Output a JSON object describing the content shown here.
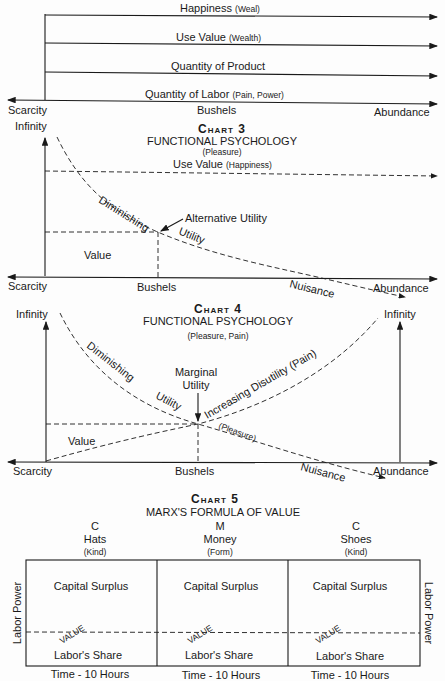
{
  "chart2": {
    "lines": [
      {
        "main": "Happiness",
        "paren": "(Weal)"
      },
      {
        "main": "Use Value",
        "paren": "(Wealth)"
      },
      {
        "main": "Quantity of Product",
        "paren": ""
      },
      {
        "main": "Quantity of Labor",
        "paren": "(Pain, Power)"
      }
    ],
    "axis_left": "Scarcity",
    "axis_center": "Bushels",
    "axis_right": "Abundance"
  },
  "chart3": {
    "title": "Chart 3",
    "subtitle": "FUNCTIONAL PSYCHOLOGY",
    "subnote": "(Pleasure)",
    "y_top": "Infinity",
    "use_value": "Use Value",
    "use_value_paren": "(Happiness)",
    "curve_label_1": "Diminishing",
    "curve_label_2": "Utility",
    "alt_utility": "Alternative Utility",
    "value": "Value",
    "nuisance": "Nuisance",
    "axis_left": "Scarcity",
    "axis_center": "Bushels",
    "axis_right": "Abundance"
  },
  "chart4": {
    "title": "Chart 4",
    "subtitle": "FUNCTIONAL PSYCHOLOGY",
    "subnote": "(Pleasure, Pain)",
    "y_top_left": "Infinity",
    "y_top_right": "Infinity",
    "curve_label_1": "Diminishing",
    "curve_label_2": "Utility",
    "marginal_1": "Marginal",
    "marginal_2": "Utility",
    "disutility": "Increasing Disutility (Pain)",
    "pleasure": "(Pleasure)",
    "value": "Value",
    "nuisance": "Nuisance",
    "axis_left": "Scarcity",
    "axis_center": "Bushels",
    "axis_right": "Abundance"
  },
  "chart5": {
    "title": "Chart 5",
    "subtitle": "MARX'S FORMULA OF VALUE",
    "columns": [
      {
        "letter": "C",
        "name": "Hats",
        "kind": "(Kind)",
        "top": "Capital Surplus",
        "value": "VALUE",
        "bottom": "Labor's Share",
        "time": "Time - 10 Hours"
      },
      {
        "letter": "M",
        "name": "Money",
        "kind": "(Form)",
        "top": "Capital Surplus",
        "value": "VALUE",
        "bottom": "Labor's Share",
        "time": "Time - 10 Hours"
      },
      {
        "letter": "C",
        "name": "Shoes",
        "kind": "(Kind)",
        "top": "Capital Surplus",
        "value": "VALUE",
        "bottom": "Labor's Share",
        "time": "Time - 10 Hours"
      }
    ],
    "side_left": "Labor Power",
    "side_right": "Labor Power"
  }
}
